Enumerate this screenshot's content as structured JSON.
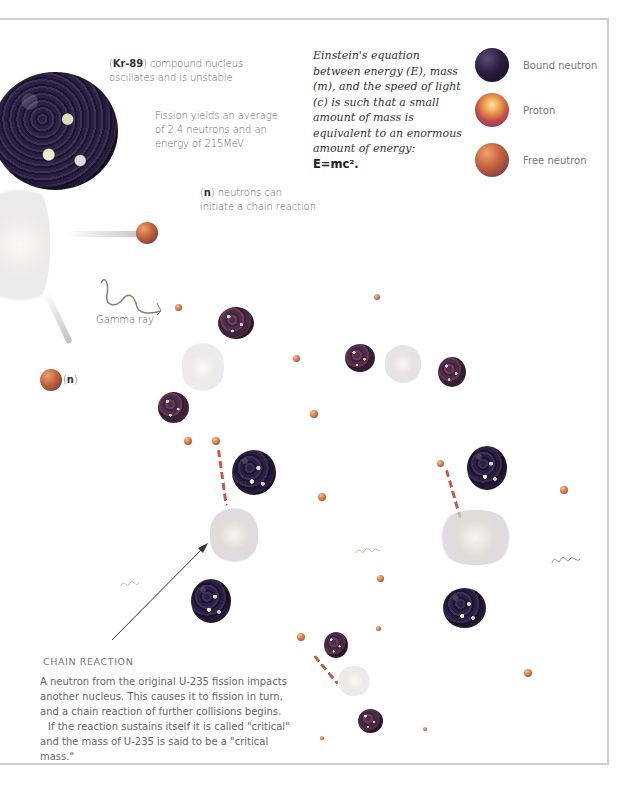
{
  "annotations": {
    "kr89": {
      "bold": "Kr-89",
      "line1_pre": "(",
      "line1_post": ") compound nucleus",
      "line2": "oscillates and is unstable"
    },
    "fission_yield": {
      "line1": "Fission yields an average",
      "line2": "of 2.4 neutrons and an",
      "line3": "energy of 215MeV"
    },
    "neutrons_chain": {
      "bold": "n",
      "line1_pre": "(",
      "line1_post": ") neutrons can",
      "line2": "initiate a chain reaction"
    },
    "gamma_ray": "Gamma ray",
    "n_label": {
      "pre": "(",
      "bold": "n",
      "post": ")"
    }
  },
  "einstein": {
    "text": "Einstein's equation between energy (E), mass (m), and the speed of light (c) is such that a small amount of mass is equivalent to an enormous amount of energy:",
    "equation": "E=mc²."
  },
  "legend": {
    "items": [
      {
        "label": "Bound neutron",
        "color": "#2a1e40"
      },
      {
        "label": "Proton",
        "color": "#e99a4a"
      },
      {
        "label": "Free neutron",
        "color": "#c0603a"
      }
    ]
  },
  "chain_reaction": {
    "heading": "CHAIN REACTION",
    "para1": "A neutron from the original U-235 fission impacts another nucleus. This causes it to fission in turn, and a chain reaction of further collisions begins.",
    "para2": "If the reaction sustains itself it is called \"critical\" and the mass of U-235 is said to be a \"critical mass.\""
  },
  "colors": {
    "frame_border": "#cfcfcf",
    "bound_neutron": "#2a1e40",
    "proton": "#e99a4a",
    "free_neutron": "#c0603a",
    "trail_dash": "#c65a48"
  }
}
